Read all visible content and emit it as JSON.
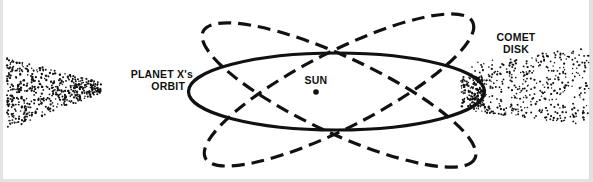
{
  "diagram": {
    "labels": {
      "planet_orbit_line1": "PLANET X's",
      "planet_orbit_line2": "ORBIT",
      "sun": "SUN",
      "comet_disk_line1": "COMET",
      "comet_disk_line2": "DISK"
    },
    "elements": [
      {
        "id": "sun",
        "type": "point",
        "label": "SUN"
      },
      {
        "id": "planet-x-orbit",
        "type": "ellipse",
        "style": "solid",
        "label": "PLANET X's ORBIT"
      },
      {
        "id": "alt-orbit-descending",
        "type": "ellipse",
        "style": "dashed",
        "tilt": "descending"
      },
      {
        "id": "alt-orbit-ascending",
        "type": "ellipse",
        "style": "dashed",
        "tilt": "ascending"
      },
      {
        "id": "comet-disk-left",
        "type": "dot-cloud",
        "side": "left"
      },
      {
        "id": "comet-disk-right",
        "type": "dot-cloud",
        "side": "right",
        "label": "COMET DISK"
      }
    ],
    "colors": {
      "ink": "#111111",
      "background": "#ffffff",
      "border": "#e2e2e2"
    }
  }
}
